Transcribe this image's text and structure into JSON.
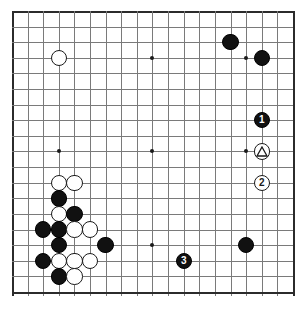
{
  "board": {
    "name": "go-board",
    "size": 19,
    "grid_origin_x": 13,
    "grid_origin_y": 12,
    "grid_spacing": 15.61,
    "line_color": "#7a7a7a",
    "edge_color": "#2b2b2b",
    "background": "#ffffff",
    "star_point_lines": [
      4,
      10,
      16
    ],
    "stone_radius": 8.2
  },
  "stones": [
    {
      "name": "white-stone",
      "color": "white",
      "col": 4,
      "row": 4,
      "label": "",
      "mark": ""
    },
    {
      "name": "black-stone",
      "color": "black",
      "col": 15,
      "row": 3,
      "label": "",
      "mark": ""
    },
    {
      "name": "black-stone",
      "color": "black",
      "col": 17,
      "row": 4,
      "label": "",
      "mark": ""
    },
    {
      "name": "black-move-1",
      "color": "black",
      "col": 17,
      "row": 8,
      "label": "1",
      "mark": ""
    },
    {
      "name": "white-stone-triangle",
      "color": "white",
      "col": 17,
      "row": 10,
      "label": "",
      "mark": "triangle"
    },
    {
      "name": "white-move-2",
      "color": "white",
      "col": 17,
      "row": 12,
      "label": "2",
      "mark": ""
    },
    {
      "name": "white-stone",
      "color": "white",
      "col": 4,
      "row": 12,
      "label": "",
      "mark": ""
    },
    {
      "name": "white-stone",
      "color": "white",
      "col": 5,
      "row": 12,
      "label": "",
      "mark": ""
    },
    {
      "name": "black-stone",
      "color": "black",
      "col": 4,
      "row": 13,
      "label": "",
      "mark": ""
    },
    {
      "name": "white-stone",
      "color": "white",
      "col": 4,
      "row": 14,
      "label": "",
      "mark": ""
    },
    {
      "name": "black-stone",
      "color": "black",
      "col": 5,
      "row": 14,
      "label": "",
      "mark": ""
    },
    {
      "name": "black-stone",
      "color": "black",
      "col": 3,
      "row": 15,
      "label": "",
      "mark": ""
    },
    {
      "name": "black-stone",
      "color": "black",
      "col": 4,
      "row": 15,
      "label": "",
      "mark": ""
    },
    {
      "name": "white-stone",
      "color": "white",
      "col": 5,
      "row": 15,
      "label": "",
      "mark": ""
    },
    {
      "name": "white-stone",
      "color": "white",
      "col": 6,
      "row": 15,
      "label": "",
      "mark": ""
    },
    {
      "name": "black-stone",
      "color": "black",
      "col": 4,
      "row": 16,
      "label": "",
      "mark": ""
    },
    {
      "name": "black-stone",
      "color": "black",
      "col": 7,
      "row": 16,
      "label": "",
      "mark": ""
    },
    {
      "name": "black-stone",
      "color": "black",
      "col": 3,
      "row": 17,
      "label": "",
      "mark": ""
    },
    {
      "name": "white-stone",
      "color": "white",
      "col": 4,
      "row": 17,
      "label": "",
      "mark": ""
    },
    {
      "name": "white-stone",
      "color": "white",
      "col": 5,
      "row": 17,
      "label": "",
      "mark": ""
    },
    {
      "name": "white-stone",
      "color": "white",
      "col": 6,
      "row": 17,
      "label": "",
      "mark": ""
    },
    {
      "name": "black-stone",
      "color": "black",
      "col": 4,
      "row": 18,
      "label": "",
      "mark": ""
    },
    {
      "name": "white-stone",
      "color": "white",
      "col": 5,
      "row": 18,
      "label": "",
      "mark": ""
    },
    {
      "name": "black-stone",
      "color": "black",
      "col": 16,
      "row": 16,
      "label": "",
      "mark": ""
    },
    {
      "name": "black-move-3",
      "color": "black",
      "col": 12,
      "row": 17,
      "label": "3",
      "mark": ""
    }
  ]
}
